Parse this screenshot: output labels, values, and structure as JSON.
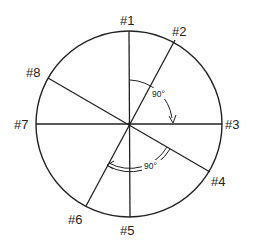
{
  "diagram": {
    "type": "circle-with-radial-lines",
    "center": [
      129,
      124
    ],
    "radius": 93,
    "stroke_color": "#222222",
    "background": "#ffffff",
    "positions": [
      {
        "id": "1",
        "label": "#1",
        "angle_deg": 90
      },
      {
        "id": "2",
        "label": "#2",
        "angle_deg": 60
      },
      {
        "id": "3",
        "label": "#3",
        "angle_deg": 0
      },
      {
        "id": "4",
        "label": "#4",
        "angle_deg": -30
      },
      {
        "id": "5",
        "label": "#5",
        "angle_deg": -90
      },
      {
        "id": "6",
        "label": "#6",
        "angle_deg": -120
      },
      {
        "id": "7",
        "label": "#7",
        "angle_deg": 180
      },
      {
        "id": "8",
        "label": "#8",
        "angle_deg": 150
      }
    ],
    "angle_annotations": [
      {
        "label": "90°",
        "from": "#1",
        "to": "#3",
        "style": "single-arc-arrow"
      },
      {
        "label": "90°",
        "from": "#4",
        "to": "#6",
        "style": "double-arc-arrow"
      }
    ]
  }
}
